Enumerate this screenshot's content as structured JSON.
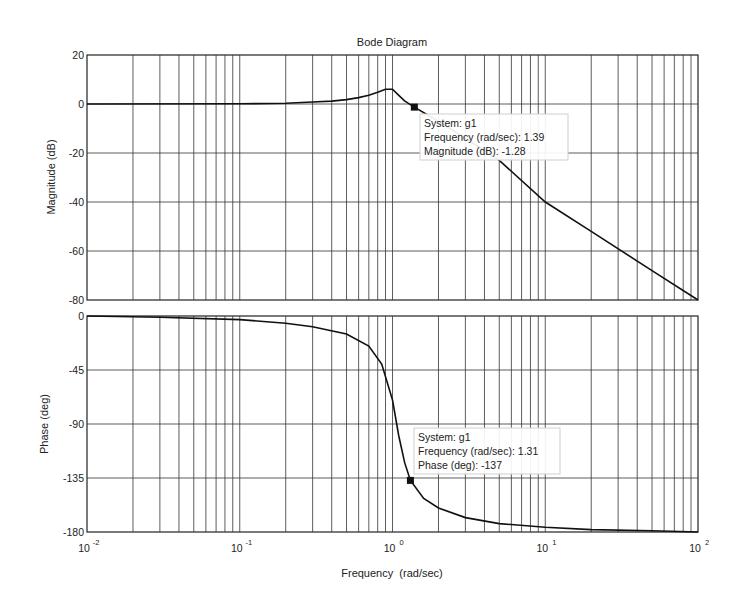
{
  "chart_data": {
    "type": "line",
    "title": "Bode Diagram",
    "xlabel": "Frequency  (rad/sec)",
    "xscale": "log",
    "xlim": [
      0.01,
      100
    ],
    "x_ticks": [
      {
        "base": "10",
        "exp": "-2",
        "value": 0.01
      },
      {
        "base": "10",
        "exp": "-1",
        "value": 0.1
      },
      {
        "base": "10",
        "exp": "0",
        "value": 1
      },
      {
        "base": "10",
        "exp": "1",
        "value": 10
      },
      {
        "base": "10",
        "exp": "2",
        "value": 100
      }
    ],
    "grid": true,
    "subplots": [
      {
        "name": "magnitude",
        "ylabel": "Magnitude (dB)",
        "ylim": [
          -80,
          20
        ],
        "y_ticks": [
          "20",
          "0",
          "-20",
          "-40",
          "-60",
          "-80"
        ],
        "series": [
          {
            "name": "g1",
            "x": [
              0.01,
              0.1,
              0.2,
              0.3,
              0.4,
              0.5,
              0.6,
              0.7,
              0.8,
              0.9,
              1.0,
              1.1,
              1.2,
              1.39,
              2,
              3,
              5,
              10,
              20,
              50,
              100
            ],
            "y": [
              0,
              0.1,
              0.3,
              0.8,
              1.2,
              1.8,
              2.6,
              3.6,
              4.8,
              6.0,
              6.0,
              3.5,
              1.3,
              -1.28,
              -7,
              -14,
              -23,
              -40,
              -52,
              -68,
              -80
            ]
          }
        ],
        "datatip": {
          "system": "System: g1",
          "frequency": "Frequency (rad/sec): 1.39",
          "value": "Magnitude (dB): -1.28",
          "x": 1.39,
          "y": -1.28
        }
      },
      {
        "name": "phase",
        "ylabel": "Phase (deg)",
        "ylim": [
          -180,
          0
        ],
        "y_ticks": [
          "0",
          "-45",
          "-90",
          "-135",
          "-180"
        ],
        "series": [
          {
            "name": "g1",
            "x": [
              0.01,
              0.03,
              0.1,
              0.2,
              0.3,
              0.5,
              0.7,
              0.85,
              1.0,
              1.1,
              1.2,
              1.31,
              1.6,
              2,
              3,
              5,
              10,
              20,
              50,
              100
            ],
            "y": [
              0,
              -1,
              -3,
              -6,
              -9,
              -15,
              -25,
              -40,
              -70,
              -100,
              -122,
              -137,
              -152,
              -160,
              -168,
              -173,
              -176,
              -178,
              -179,
              -180
            ]
          }
        ],
        "datatip": {
          "system": "System: g1",
          "frequency": "Frequency (rad/sec): 1.31",
          "value": "Phase (deg): -137",
          "x": 1.31,
          "y": -137
        }
      }
    ]
  }
}
